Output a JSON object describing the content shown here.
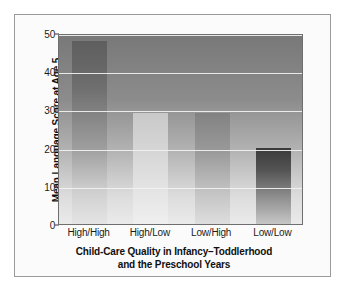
{
  "chart_data": {
    "type": "bar",
    "title": "",
    "categories": [
      "High/High",
      "High/Low",
      "Low/High",
      "Low/Low"
    ],
    "values": [
      48,
      29,
      29,
      20
    ],
    "xlabel_line1": "Child-Care Quality in Infancy–Toddlerhood",
    "xlabel_line2": "and the Preschool Years",
    "ylabel": "Mean Language Score at Age 5",
    "ylim": [
      0,
      50
    ],
    "yticks": [
      0,
      10,
      20,
      30,
      40,
      50
    ],
    "ytick_labels": [
      "0",
      "10",
      "20",
      "30",
      "40",
      "50"
    ],
    "grid": true,
    "legend": false,
    "bar_colors": [
      "#6e6e6e",
      "#d4d4d4",
      "#9a9a9a",
      "#555555"
    ]
  },
  "figure": {
    "caption": ""
  }
}
